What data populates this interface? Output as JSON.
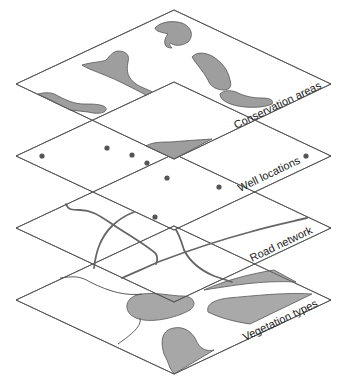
{
  "diagram": {
    "type": "stacked-gis-layers",
    "layers": [
      {
        "id": "conservation",
        "label": "Conservation areas",
        "fill": "#ededed",
        "feature_fill": "#9e9e9e",
        "feature_type": "polygons"
      },
      {
        "id": "wells",
        "label": "Well locations",
        "fill": "#e8e8e8",
        "feature_fill": "#555555",
        "feature_type": "points",
        "point_count": 8
      },
      {
        "id": "roads",
        "label": "Road network",
        "fill": "#eeeeee",
        "feature_fill": "#666666",
        "feature_type": "lines"
      },
      {
        "id": "vegetation",
        "label": "Vegetation types",
        "fill": "#b9b9b9",
        "feature_fill": "#a6a6a6",
        "feature_type": "polygons"
      }
    ],
    "colors": {
      "background": "#ffffff",
      "edge": "#555555",
      "text": "#222222"
    }
  }
}
